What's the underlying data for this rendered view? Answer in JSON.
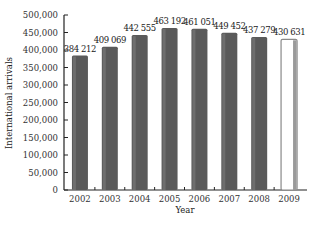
{
  "chart_data": {
    "type": "bar",
    "title": "",
    "xlabel": "Year",
    "ylabel": "International arrivals",
    "ylim": [
      0,
      500000
    ],
    "yticks": [
      0,
      50000,
      100000,
      150000,
      200000,
      250000,
      300000,
      350000,
      400000,
      450000,
      500000
    ],
    "ytick_labels": [
      "0",
      "50,000",
      "100,000",
      "150,000",
      "200,000",
      "250,000",
      "300,000",
      "350,000",
      "400,000",
      "450,000",
      "500,000"
    ],
    "categories": [
      "2002",
      "2003",
      "2004",
      "2005",
      "2006",
      "2007",
      "2008",
      "2009"
    ],
    "values": [
      384212,
      409069,
      442555,
      463192,
      461051,
      449452,
      437279,
      430631
    ],
    "value_labels": [
      "384 212",
      "409 069",
      "442 555",
      "463 192",
      "461 051",
      "449 452",
      "437 279",
      "430 631"
    ],
    "grid": false,
    "legend": null,
    "colors": {
      "bar": "#5a5a5a",
      "bar_highlight": "#ffffff",
      "bar_edge_2009": "#8a8a8a",
      "axis": "#222222"
    },
    "highlight_index": 7
  }
}
